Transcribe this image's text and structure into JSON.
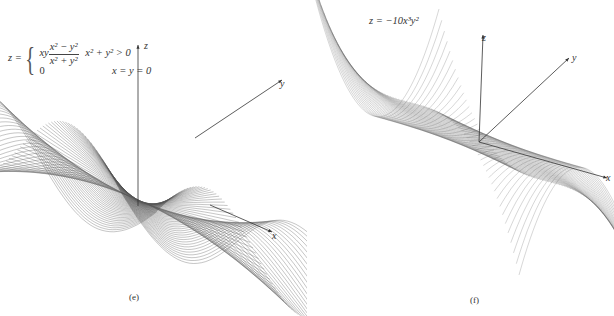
{
  "figure": {
    "panels": [
      {
        "id": "e",
        "caption": "(e)",
        "equation": {
          "lhs": "z =",
          "case1_prefix": "xy",
          "case1_num": "x² − y²",
          "case1_den": "x² + y²",
          "case1_cond": "x² + y² > 0",
          "case2_value": "0",
          "case2_cond": "x = y = 0"
        },
        "axes": {
          "x": "x",
          "y": "y",
          "z": "z"
        },
        "surface": "z = xy(x²−y²)/(x²+y²)"
      },
      {
        "id": "f",
        "caption": "(f)",
        "equation": {
          "text": "z = −10x³y²"
        },
        "axes": {
          "x": "x",
          "y": "y",
          "z": "z"
        },
        "surface": "z = −10x³y²"
      }
    ]
  },
  "chart_data": [
    {
      "type": "surface",
      "title": "z = xy(x² − y²)/(x² + y²), z = 0 at x = y = 0",
      "caption": "(e)",
      "axes_labels": [
        "x",
        "y",
        "z"
      ],
      "render": "wireframe mesh, grey lines, white background"
    },
    {
      "type": "surface",
      "title": "z = −10x³y²",
      "caption": "(f)",
      "axes_labels": [
        "x",
        "y",
        "z"
      ],
      "render": "wireframe mesh, grey lines, white background"
    }
  ],
  "colors": {
    "mesh": "#555555",
    "axis": "#333333",
    "background": "#ffffff"
  }
}
